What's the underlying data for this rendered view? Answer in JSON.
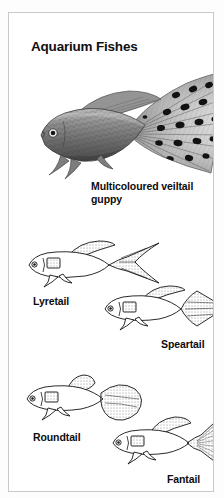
{
  "page": {
    "title": "Aquarium Fishes",
    "background_color": "#ffffff",
    "border_color": "#c9c9c9",
    "ink_color": "#0d0d0d"
  },
  "photo": {
    "name": "multicoloured-veiltail-guppy-photograph",
    "caption": "Multicoloured veiltail guppy",
    "caption_line_1": "Multicoloured veiltail",
    "caption_line_2": "guppy",
    "style": "black-and-white halftone photograph",
    "subject": "male guppy with large spotted veil-shaped caudal fin"
  },
  "diagrams": [
    {
      "id": "lyretail",
      "label": "Lyretail",
      "description": "guppy line drawing with deeply forked lyre-shaped caudal fin"
    },
    {
      "id": "speartail",
      "label": "Speartail",
      "description": "guppy line drawing with pointed diamond spear-shaped caudal fin"
    },
    {
      "id": "roundtail",
      "label": "Roundtail",
      "description": "guppy line drawing with broad rounded caudal fin"
    },
    {
      "id": "fantail",
      "label": "Fantail",
      "description": "guppy line drawing with wide triangular fan-shaped caudal fin"
    }
  ]
}
